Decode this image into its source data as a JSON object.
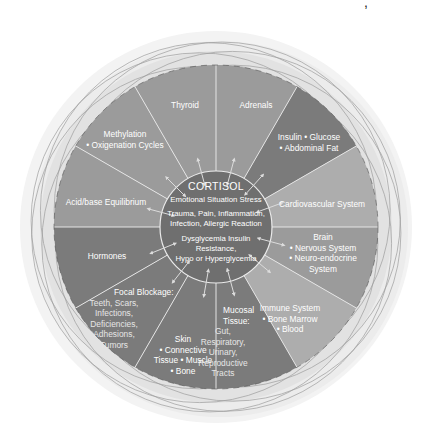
{
  "diagram": {
    "center": {
      "x": 216,
      "y": 227
    },
    "outer_radius": 162,
    "inner_radius": 56,
    "halo_radius": 196,
    "colors": {
      "halo": "#ececec",
      "halo_inner": "#e2e2e2",
      "ring_lines": "#9c9c9c",
      "dark": "#7b7b7b",
      "medium": "#9b9b9b",
      "light": "#adadad",
      "inner_circle": "#6f6f6f",
      "divider": "#e4e4e4",
      "arrow": "#dcdcdc"
    },
    "segments": [
      {
        "id": "thyroid",
        "start": 240,
        "end": 270,
        "shade": "medium",
        "lines": [
          "Thyroid"
        ],
        "label_pos": [
          185,
          108
        ]
      },
      {
        "id": "adrenals",
        "start": 270,
        "end": 300,
        "shade": "medium",
        "lines": [
          "Adrenals"
        ],
        "label_pos": [
          256,
          108
        ]
      },
      {
        "id": "insulin",
        "start": 300,
        "end": 330,
        "shade": "dark",
        "lines": [
          "Insulin • Glucose",
          "• Abdominal Fat"
        ],
        "label_pos": [
          309,
          140
        ]
      },
      {
        "id": "cardiovascular",
        "start": 330,
        "end": 360,
        "shade": "light",
        "lines": [
          "Cardiovascular System"
        ],
        "label_pos": [
          322,
          207
        ]
      },
      {
        "id": "brain",
        "start": 0,
        "end": 30,
        "shade": "medium",
        "lines": [
          "Brain",
          "• Nervous System",
          "• Neuro-endocrine",
          "System"
        ],
        "label_pos": [
          323,
          240
        ]
      },
      {
        "id": "immune",
        "start": 30,
        "end": 60,
        "shade": "light",
        "lines": [
          "Immune System",
          "• Bone Marrow",
          "• Blood"
        ],
        "label_pos": [
          290,
          311
        ]
      },
      {
        "id": "mucosal",
        "start": 60,
        "end": 90,
        "shade": "dark",
        "lines": [
          "Mucosal",
          "Tissue:",
          "Gut,",
          "Respiratory,",
          "Urinary,",
          "Reproductive",
          "Tracts"
        ],
        "label_pos": [
          223,
          313
        ],
        "align": "start"
      },
      {
        "id": "skin",
        "start": 90,
        "end": 120,
        "shade": "dark",
        "lines": [
          "Skin",
          "• Connective",
          "Tissue • Muscle",
          "• Bone"
        ],
        "label_pos": [
          183,
          342
        ]
      },
      {
        "id": "focal",
        "start": 120,
        "end": 150,
        "shade": "dark",
        "lines": [
          "Focal Blockage:",
          "Teeth, Scars,",
          "Infections,",
          "Deficiencies,",
          "Adhesions,",
          "Tumors"
        ],
        "label_pos": [
          114,
          295
        ],
        "align": "start"
      },
      {
        "id": "hormones",
        "start": 150,
        "end": 180,
        "shade": "dark",
        "lines": [
          "Hormones"
        ],
        "label_pos": [
          107,
          259
        ]
      },
      {
        "id": "acidbase",
        "start": 180,
        "end": 210,
        "shade": "medium",
        "lines": [
          "Acid/base Equilibrium"
        ],
        "label_pos": [
          106,
          205
        ]
      },
      {
        "id": "methylation",
        "start": 210,
        "end": 240,
        "shade": "medium",
        "lines": [
          "Methylation",
          "• Oxigenation Cycles"
        ],
        "label_pos": [
          125,
          137
        ]
      }
    ],
    "center_text": {
      "title": "CORTISOL",
      "line1": "Emotional Situation Stress",
      "line2a": "Trauma, Pain, Inflammation,",
      "line2b": "Infection, Allergic Reaction",
      "line3a": "Dysglycemia Insulin",
      "line3b": "Resistance,",
      "line3c": "Hypo or Hyperglycemia"
    },
    "arrow_angles": [
      255,
      285,
      312,
      340,
      15,
      40,
      75,
      100,
      128,
      158,
      195,
      225
    ]
  }
}
